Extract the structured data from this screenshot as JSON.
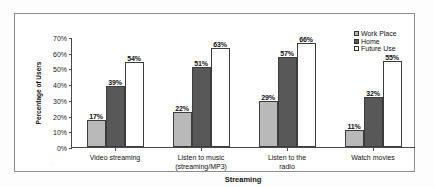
{
  "chart_data": {
    "type": "bar",
    "title": "",
    "xlabel": "Streaming",
    "ylabel": "Percentage of Users",
    "ylim": [
      0,
      70
    ],
    "ytick_labels": [
      "0%",
      "10%",
      "20%",
      "30%",
      "40%",
      "50%",
      "60%",
      "70%"
    ],
    "ytick_values": [
      0,
      10,
      20,
      30,
      40,
      50,
      60,
      70
    ],
    "grid": false,
    "legend_position": "top-right",
    "categories": [
      "Video streaming",
      "Listen to music (streaming/MP3)",
      "Listen to the radio",
      "Watch movies"
    ],
    "category_lines": [
      [
        "Video streaming"
      ],
      [
        "Listen to music",
        "(streaming/MP3)"
      ],
      [
        "Listen to the",
        "radio"
      ],
      [
        "Watch movies"
      ]
    ],
    "series": [
      {
        "name": "Work Place",
        "color": "#b9b9b9",
        "values": [
          17,
          22,
          29,
          11
        ],
        "labels": [
          "17%",
          "22%",
          "29%",
          "11%"
        ]
      },
      {
        "name": "Home",
        "color": "#585858",
        "values": [
          39,
          51,
          57,
          32
        ],
        "labels": [
          "39%",
          "51%",
          "57%",
          "32%"
        ]
      },
      {
        "name": "Future Use",
        "color": "#ffffff",
        "values": [
          54,
          63,
          66,
          55
        ],
        "labels": [
          "54%",
          "63%",
          "66%",
          "55%"
        ]
      }
    ]
  }
}
